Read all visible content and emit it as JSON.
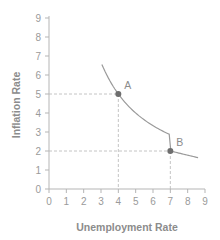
{
  "chart_data": {
    "type": "line",
    "title": "",
    "xlabel": "Unemployment Rate",
    "ylabel": "Inflation Rate",
    "xlim": [
      0,
      9
    ],
    "ylim": [
      0,
      9
    ],
    "x_ticks": [
      0,
      1,
      2,
      3,
      4,
      5,
      6,
      7,
      8,
      9
    ],
    "y_ticks": [
      0,
      1,
      2,
      3,
      4,
      5,
      6,
      7,
      8,
      9
    ],
    "grid": false,
    "legend": null,
    "series": [
      {
        "name": "Phillips Curve",
        "x": [
          3.05,
          3.5,
          4,
          4.5,
          5,
          5.5,
          6,
          6.5,
          7,
          7.5,
          8,
          8.6
        ],
        "y": [
          8.0,
          6.3,
          5.0,
          4.3,
          3.7,
          3.2,
          2.8,
          2.4,
          2.0,
          1.9,
          1.8,
          1.65
        ]
      }
    ],
    "points": [
      {
        "label": "A",
        "x": 4,
        "y": 5
      },
      {
        "label": "B",
        "x": 7,
        "y": 2
      }
    ],
    "annotations": "Dashed reference lines from points A and B to both axes"
  },
  "colors": {
    "axis": "#b5b5b5",
    "tick_text": "#9a9a9a",
    "label_text": "#8c8c8c",
    "curve": "#9a9a9a",
    "point": "#6e6e6e",
    "dash": "#c4c4c4"
  }
}
